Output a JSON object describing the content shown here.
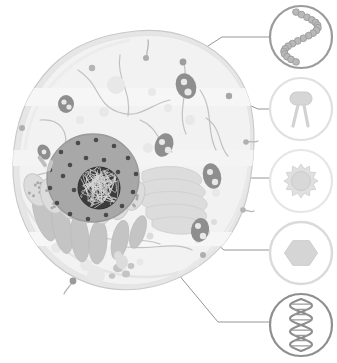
{
  "figure": {
    "type": "biological-diagram",
    "background": "#ffffff",
    "canvas": {
      "width": 337,
      "height": 363
    }
  },
  "palette": {
    "cytoplasm_fill": "#f2f2f2",
    "cytoplasm_edge": "#e2e2e2",
    "membrane_stroke": "#c9c9c9",
    "membrane_band": "#e6e6e6",
    "nucleus_fill": "#a8a8a8",
    "nucleus_edge": "#9a9a9a",
    "nuclear_pore": "#4a4a4a",
    "nucleolus_fill": "#3c3c3c",
    "chromatin_stroke": "#d8d8d8",
    "organelle_mid": "#c4c4c4",
    "organelle_light": "#dcdcdc",
    "organelle_pale": "#e8e8e8",
    "vesicle_dark": "#8e8e8e",
    "filament": "#b8b8b8",
    "leader_line": "#8a8a8a",
    "callout_ring_dark": "#9b9b9b",
    "callout_ring_light": "#dcdcdc",
    "callout_fill": "#ffffff"
  },
  "cell": {
    "name": "animal-cell",
    "membrane_label": "plasma membrane",
    "membrane_proteins": [
      {
        "cx": 92,
        "cy": 68,
        "r": 3.2,
        "shade": "#b4b4b4"
      },
      {
        "cx": 146,
        "cy": 58,
        "r": 3.0,
        "shade": "#aeaeae"
      },
      {
        "cx": 183,
        "cy": 62,
        "r": 3.4,
        "shade": "#9e9e9e"
      },
      {
        "cx": 229,
        "cy": 96,
        "r": 3.2,
        "shade": "#a6a6a6"
      },
      {
        "cx": 246,
        "cy": 142,
        "r": 2.8,
        "shade": "#b0b0b0"
      },
      {
        "cx": 243,
        "cy": 210,
        "r": 2.8,
        "shade": "#b4b4b4"
      },
      {
        "cx": 203,
        "cy": 255,
        "r": 3.0,
        "shade": "#aeaeae"
      },
      {
        "cx": 22,
        "cy": 128,
        "r": 3.0,
        "shade": "#b0b0b0"
      },
      {
        "cx": 73,
        "cy": 281,
        "r": 3.4,
        "shade": "#9a9a9a"
      }
    ],
    "cilia": [
      {
        "path": "M147,57 C146,49 150,45 148,40"
      },
      {
        "path": "M246,142 C252,141 255,143 258,141"
      },
      {
        "path": "M243,210 C248,210 251,213 254,211"
      },
      {
        "path": "M73,281 C70,287 66,289 64,294"
      }
    ],
    "nucleus": {
      "label": "nucleus",
      "cx": 93,
      "cy": 178,
      "rx": 46,
      "ry": 44,
      "pore_count": 22,
      "pores": [
        [
          61,
          152
        ],
        [
          78,
          143
        ],
        [
          96,
          140
        ],
        [
          114,
          146
        ],
        [
          128,
          158
        ],
        [
          136,
          174
        ],
        [
          133,
          192
        ],
        [
          122,
          206
        ],
        [
          106,
          215
        ],
        [
          88,
          219
        ],
        [
          70,
          214
        ],
        [
          57,
          203
        ],
        [
          50,
          188
        ],
        [
          50,
          170
        ],
        [
          70,
          165
        ],
        [
          86,
          158
        ],
        [
          104,
          160
        ],
        [
          118,
          172
        ],
        [
          112,
          190
        ],
        [
          92,
          197
        ],
        [
          74,
          190
        ],
        [
          63,
          176
        ]
      ]
    },
    "nucleolus": {
      "label": "nucleolus (chromatin)",
      "cx": 99,
      "cy": 188,
      "r": 21,
      "strand_count": 26
    },
    "rough_er": {
      "label": "rough endoplasmic reticulum",
      "cisterna_count": 7,
      "ribosome_dots": 46
    },
    "golgi": {
      "label": "golgi apparatus",
      "stack_count": 5,
      "cx": 168,
      "cy": 196
    },
    "mitochondria": {
      "label": "mitochondria",
      "count": 5
    },
    "lysosomes": {
      "label": "lysosomes / vesicles",
      "count": 8
    },
    "smooth_er": {
      "label": "smooth endoplasmic reticulum filaments",
      "count": 9
    },
    "free_vesicles": {
      "label": "cytoplasmic vesicles",
      "count": 14
    }
  },
  "callouts": [
    {
      "id": "callout-1",
      "icon": "beaded-chain-icon",
      "label": "beaded chain / nucleosome string",
      "cx": 301,
      "cy": 37,
      "r": 31,
      "ring": "#9b9b9b",
      "ring_width": 2.2,
      "bead_count": 20,
      "leader": "M183,62 L222,37 L270,37"
    },
    {
      "id": "callout-2",
      "icon": "membrane-receptor-icon",
      "label": "membrane receptor protein",
      "cx": 301,
      "cy": 109,
      "r": 31,
      "ring": "#e0e0e0",
      "ring_width": 2.2,
      "leader": "M229,96 L258,109 L270,109"
    },
    {
      "id": "callout-3",
      "icon": "spiked-vesicle-icon",
      "label": "spiked vesicle / virion",
      "cx": 301,
      "cy": 181,
      "r": 31,
      "ring": "#e6e6e6",
      "ring_width": 2.2,
      "spike_count": 12,
      "leader": "M222,178 L270,178"
    },
    {
      "id": "callout-4",
      "icon": "hexagon-particle-icon",
      "label": "hexagonal particle / capsid",
      "cx": 301,
      "cy": 253,
      "r": 31,
      "ring": "#dadada",
      "ring_width": 2.4,
      "leader": "M202,232 L224,250 L270,250"
    },
    {
      "id": "callout-5",
      "icon": "dna-helix-icon",
      "label": "DNA double helix",
      "cx": 301,
      "cy": 325,
      "r": 31,
      "ring": "#8f8f8f",
      "ring_width": 2.2,
      "rung_count": 9,
      "leader": "M108,190 L218,322 L270,322"
    }
  ]
}
